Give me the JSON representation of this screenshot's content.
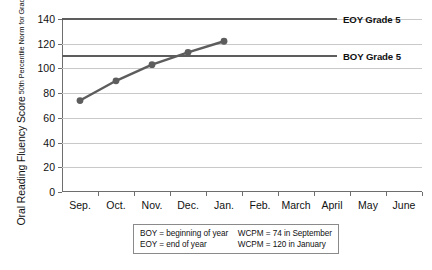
{
  "chart_data": {
    "type": "line",
    "title": "",
    "xlabel": "",
    "ylabel": "Oral Reading Fluency Score",
    "ylabel_sub": "50th Percentile Norm for Grade 5",
    "categories": [
      "Sep.",
      "Oct.",
      "Nov.",
      "Dec.",
      "Jan.",
      "Feb.",
      "March",
      "April",
      "May",
      "June"
    ],
    "ylim": [
      0,
      140
    ],
    "yticks": [
      0,
      20,
      40,
      60,
      80,
      100,
      120,
      140
    ],
    "grid": true,
    "legend_position": "right-inline",
    "series": [
      {
        "name": "Student progress",
        "values": [
          74,
          90,
          103,
          113,
          122,
          null,
          null,
          null,
          null,
          null
        ],
        "color": "#5d5d5d",
        "marker": "circle"
      }
    ],
    "reference_lines": [
      {
        "name": "EOY Grade 5",
        "value": 140,
        "label": "EOY Grade 5",
        "color": "#5d5d5d"
      },
      {
        "name": "BOY Grade 5",
        "value": 110,
        "label": "BOY Grade 5",
        "color": "#5d5d5d"
      }
    ],
    "annotations": {
      "boy_definition": "BOY = beginning of year",
      "eoy_definition": "EOY = end of year",
      "wcpm_september": "WCPM = 74 in September",
      "wcpm_january": "WCPM = 120 in January"
    }
  },
  "axis": {
    "y_title_main": "Oral Reading Fluency Score",
    "y_title_sub": "50th Percentile Norm for Grade 5",
    "y_tick_labels": [
      "0",
      "20",
      "40",
      "60",
      "80",
      "100",
      "120",
      "140"
    ],
    "x_tick_labels": [
      "Sep.",
      "Oct.",
      "Nov.",
      "Dec.",
      "Jan.",
      "Feb.",
      "March",
      "April",
      "May",
      "June"
    ]
  },
  "benchmarks": {
    "eoy_label": "EOY Grade 5",
    "boy_label": "BOY Grade 5"
  },
  "footnote": {
    "left": [
      "BOY = beginning of year",
      "EOY = end of year"
    ],
    "right": [
      "WCPM = 74 in September",
      "WCPM = 120 in January"
    ]
  },
  "colors": {
    "series": "#5d5d5d",
    "benchmark": "#5d5d5d",
    "grid": "#c9c9c9",
    "axis": "#6e6e6e",
    "text": "#111111"
  }
}
